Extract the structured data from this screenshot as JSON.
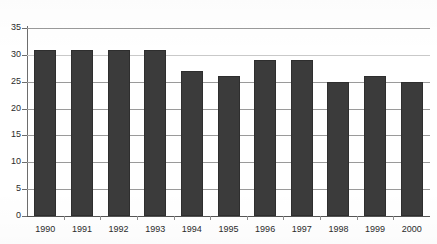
{
  "chart_data": {
    "type": "bar",
    "title": "",
    "subtitle": "",
    "xlabel": "",
    "ylabel": "",
    "categories": [
      "1990",
      "1991",
      "1992",
      "1993",
      "1994",
      "1995",
      "1996",
      "1997",
      "1998",
      "1999",
      "2000"
    ],
    "values": [
      31,
      31,
      31,
      31,
      27,
      26,
      29,
      29,
      25,
      26,
      25
    ],
    "series": [
      {
        "name": "",
        "values": [
          31,
          31,
          31,
          31,
          27,
          26,
          29,
          29,
          25,
          26,
          25
        ]
      }
    ],
    "ylim": [
      0,
      35
    ],
    "y_ticks": [
      0,
      5,
      10,
      15,
      20,
      25,
      30,
      35
    ],
    "y_tick_labels": [
      "0",
      "5",
      "10",
      "15",
      "20",
      "25",
      "30",
      "35"
    ],
    "grid": "horizontal",
    "legend": "none",
    "bar_color": "#3b3b3b",
    "gridline_color": "#9a9a9a",
    "axis_color": "#6d6d6d",
    "background_color": "#ffffff",
    "annotations": []
  }
}
